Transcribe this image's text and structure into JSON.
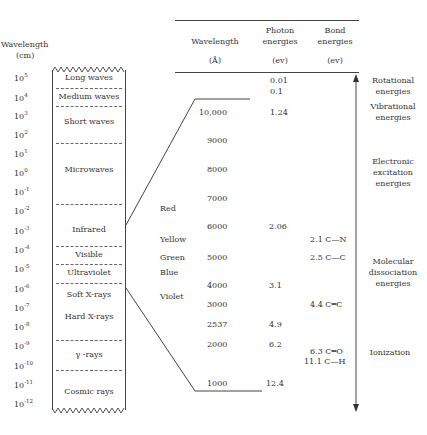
{
  "left_axis": {
    "title": "Wavelength",
    "unit": "(cm)",
    "ticks": [
      {
        "base": "10",
        "exp": "5"
      },
      {
        "base": "10",
        "exp": "4"
      },
      {
        "base": "10",
        "exp": "3"
      },
      {
        "base": "10",
        "exp": "2"
      },
      {
        "base": "10",
        "exp": "1"
      },
      {
        "base": "10",
        "exp": "0"
      },
      {
        "base": "10",
        "exp": "-1"
      },
      {
        "base": "10",
        "exp": "-2"
      },
      {
        "base": "10",
        "exp": "-3"
      },
      {
        "base": "10",
        "exp": "-4"
      },
      {
        "base": "10",
        "exp": "-5"
      },
      {
        "base": "10",
        "exp": "-6"
      },
      {
        "base": "10",
        "exp": "-7"
      },
      {
        "base": "10",
        "exp": "-8"
      },
      {
        "base": "10",
        "exp": "-9"
      },
      {
        "base": "10",
        "exp": "-10"
      },
      {
        "base": "10",
        "exp": "-11"
      },
      {
        "base": "10",
        "exp": "-12"
      }
    ]
  },
  "spectrum_bands": [
    "Long waves",
    "Medium waves",
    "Short waves",
    "Microwaves",
    "Infrared",
    "Visible",
    "Ultraviolet",
    "Soft X-rays",
    "Hard X-rays",
    "γ -rays",
    "Cosmic rays"
  ],
  "table": {
    "headers": {
      "wavelength": "Wavelength",
      "wavelength_unit": "(Å)",
      "photon_line1": "Photon",
      "photon_line2": "energies",
      "photon_unit": "(ev)",
      "bond_line1": "Bond",
      "bond_line2": "energies",
      "bond_unit": "(ev)"
    },
    "colors": [
      "Red",
      "Yellow",
      "Green",
      "Blue",
      "Violet"
    ],
    "wavelengths": [
      "10,000",
      "9000",
      "8000",
      "7000",
      "6000",
      "5000",
      "4000",
      "3000",
      "2537",
      "2000",
      "1000"
    ],
    "photon_energies": [
      "0.01",
      "0.1",
      "1.24",
      "2.06",
      "3.1",
      "4.9",
      "6.2",
      "12.4"
    ],
    "bond_energies": [
      "2.1 C—N",
      "2.5 C—C",
      "4.4 C═C",
      "6.3 C═O",
      "11.1 C—H"
    ]
  },
  "energy_regions": {
    "rotational": [
      "Rotational",
      "energies"
    ],
    "vibrational": [
      "Vibrational",
      "energies"
    ],
    "electronic": [
      "Electronic",
      "excitation",
      "energies"
    ],
    "molecular": [
      "Molecular",
      "dissociation",
      "energies"
    ],
    "ionization": [
      "Ionization"
    ]
  }
}
